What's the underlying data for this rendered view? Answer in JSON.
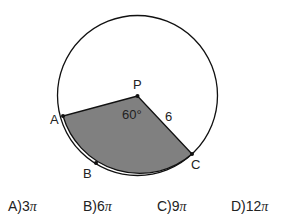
{
  "diagram": {
    "center_label": "P",
    "points": {
      "A": "A",
      "B": "B",
      "C": "C"
    },
    "angle_label": "60°",
    "radius_label": "6",
    "shaded_color": "#808080"
  },
  "choices": [
    {
      "letter": "A)",
      "value": "3",
      "symbol": "π"
    },
    {
      "letter": "B)",
      "value": "6",
      "symbol": "π"
    },
    {
      "letter": "C)",
      "value": "9",
      "symbol": "π"
    },
    {
      "letter": "D)",
      "value": "12",
      "symbol": "π"
    }
  ]
}
